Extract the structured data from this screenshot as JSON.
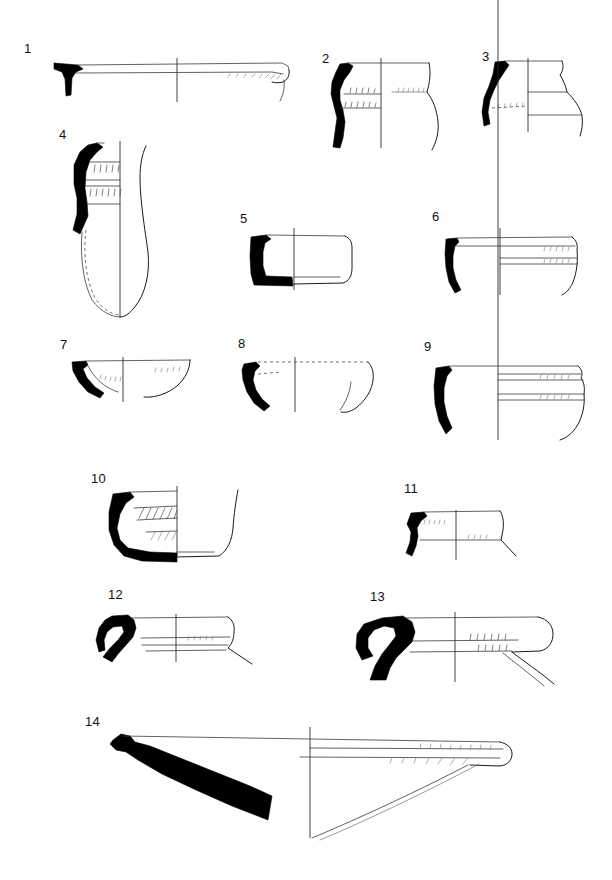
{
  "plate": {
    "title": "Pottery profile plate",
    "description": "Archaeological line-drawing plate of fourteen numbered ceramic vessel profiles. Each drawing shows a section (solid black, left of the central axis) with the reconstructed exterior profile (outline, right of the axis).",
    "width": 612,
    "height": 880,
    "background_color": "#ffffff",
    "ink_color": "#000000",
    "figure_count": 14,
    "labels": [
      {
        "id": "1",
        "text": "1",
        "x": 24,
        "y": 48
      },
      {
        "id": "2",
        "text": "2",
        "x": 322,
        "y": 58
      },
      {
        "id": "3",
        "text": "3",
        "x": 482,
        "y": 54
      },
      {
        "id": "4",
        "text": "4",
        "x": 59,
        "y": 132
      },
      {
        "id": "5",
        "text": "5",
        "x": 240,
        "y": 218
      },
      {
        "id": "6",
        "text": "6",
        "x": 432,
        "y": 216
      },
      {
        "id": "7",
        "text": "7",
        "x": 60,
        "y": 344
      },
      {
        "id": "8",
        "text": "8",
        "x": 238,
        "y": 343
      },
      {
        "id": "9",
        "text": "9",
        "x": 424,
        "y": 346
      },
      {
        "id": "10",
        "text": "10",
        "x": 91,
        "y": 478
      },
      {
        "id": "11",
        "text": "11",
        "x": 404,
        "y": 488
      },
      {
        "id": "12",
        "text": "12",
        "x": 108,
        "y": 594
      },
      {
        "id": "13",
        "text": "13",
        "x": 370,
        "y": 596
      },
      {
        "id": "14",
        "text": "14",
        "x": 85,
        "y": 721
      }
    ],
    "figures": [
      {
        "number": "1",
        "name": "figure-1-shallow-platter-rim",
        "row": 1,
        "form": "very shallow platter / large flat dish with thickened rim"
      },
      {
        "number": "2",
        "name": "figure-2-jar-neck",
        "row": 1,
        "form": "jar with everted rim, constricted neck and swelling body"
      },
      {
        "number": "3",
        "name": "figure-3-carinated-jar",
        "row": 1,
        "form": "small jar with flaring rim and carinated shoulder"
      },
      {
        "number": "4",
        "name": "figure-4-tall-beaker",
        "row": 2,
        "form": "tall pointed beaker / amphoriskos with grooved neck"
      },
      {
        "number": "5",
        "name": "figure-5-straight-sided-cup",
        "row": 2,
        "form": "straight-sided cup / box with flat base"
      },
      {
        "number": "6",
        "name": "figure-6-bowl-grooved-rim",
        "row": 2,
        "form": "deep bowl with grooved rim band"
      },
      {
        "number": "7",
        "name": "figure-7-shallow-bowl",
        "row": 3,
        "form": "shallow hemispherical bowl"
      },
      {
        "number": "8",
        "name": "figure-8-small-cup",
        "row": 3,
        "form": "small incurving cup with ring base"
      },
      {
        "number": "9",
        "name": "figure-9-ribbed-bowl",
        "row": 3,
        "form": "deep bowl with ribbed exterior band"
      },
      {
        "number": "10",
        "name": "figure-10-hatched-bowl",
        "row": 4,
        "form": "deep bowl with hatched interior decoration and flat base"
      },
      {
        "number": "11",
        "name": "figure-11-ledge-rim-bowl",
        "row": 4,
        "form": "small bowl with ledge rim"
      },
      {
        "number": "12",
        "name": "figure-12-hooked-rim-basin",
        "row": 5,
        "form": "basin with hooked / rolled rim"
      },
      {
        "number": "13",
        "name": "figure-13-rolled-rim-basin",
        "row": 5,
        "form": "large basin with heavy rolled rim"
      },
      {
        "number": "14",
        "name": "figure-14-large-platter",
        "row": 6,
        "form": "very large shallow platter with thick tapering wall"
      }
    ]
  }
}
